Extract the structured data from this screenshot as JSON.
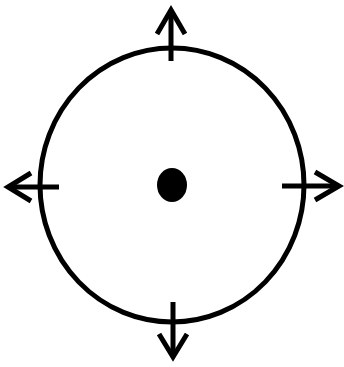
{
  "diagram": {
    "colors": {
      "stroke": "#000000",
      "background": "#ffffff",
      "dot": "#000000"
    },
    "circle": {
      "cx": 172,
      "cy": 185,
      "rx": 132,
      "ry": 137,
      "stroke_width": 5
    },
    "center_dot": {
      "cx": 172,
      "cy": 185,
      "rx": 15,
      "ry": 17
    },
    "arrows": [
      {
        "direction": "up",
        "shaft": [
          171,
          61,
          171,
          10
        ],
        "head": [
          [
            157,
            34
          ],
          [
            171,
            10
          ],
          [
            185,
            34
          ]
        ]
      },
      {
        "direction": "down",
        "shaft": [
          173,
          302,
          173,
          357
        ],
        "head": [
          [
            159,
            334
          ],
          [
            173,
            357
          ],
          [
            187,
            334
          ]
        ]
      },
      {
        "direction": "left",
        "shaft": [
          59,
          187,
          8,
          187
        ],
        "head": [
          [
            31,
            173
          ],
          [
            8,
            187
          ],
          [
            31,
            201
          ]
        ]
      },
      {
        "direction": "right",
        "shaft": [
          282,
          186,
          339,
          186
        ],
        "head": [
          [
            315,
            172
          ],
          [
            339,
            186
          ],
          [
            315,
            200
          ]
        ]
      }
    ]
  }
}
